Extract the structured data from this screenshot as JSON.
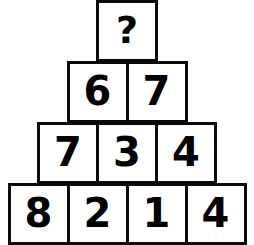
{
  "puzzle": {
    "title": "Number Pyramid",
    "unknown_symbol": "?",
    "colors": {
      "border": "#0a0a0a",
      "cell_background": "#ffffff",
      "text": "#000000",
      "page_background": "#ffffff"
    },
    "rows": [
      {
        "index": 1,
        "cells": [
          {
            "value": "?",
            "is_unknown": true
          }
        ]
      },
      {
        "index": 2,
        "cells": [
          {
            "value": "6",
            "is_unknown": false
          },
          {
            "value": "7",
            "is_unknown": false
          }
        ]
      },
      {
        "index": 3,
        "cells": [
          {
            "value": "7",
            "is_unknown": false
          },
          {
            "value": "3",
            "is_unknown": false
          },
          {
            "value": "4",
            "is_unknown": false
          }
        ]
      },
      {
        "index": 4,
        "cells": [
          {
            "value": "8",
            "is_unknown": false
          },
          {
            "value": "2",
            "is_unknown": false
          },
          {
            "value": "1",
            "is_unknown": false
          },
          {
            "value": "4",
            "is_unknown": false
          }
        ]
      }
    ]
  }
}
